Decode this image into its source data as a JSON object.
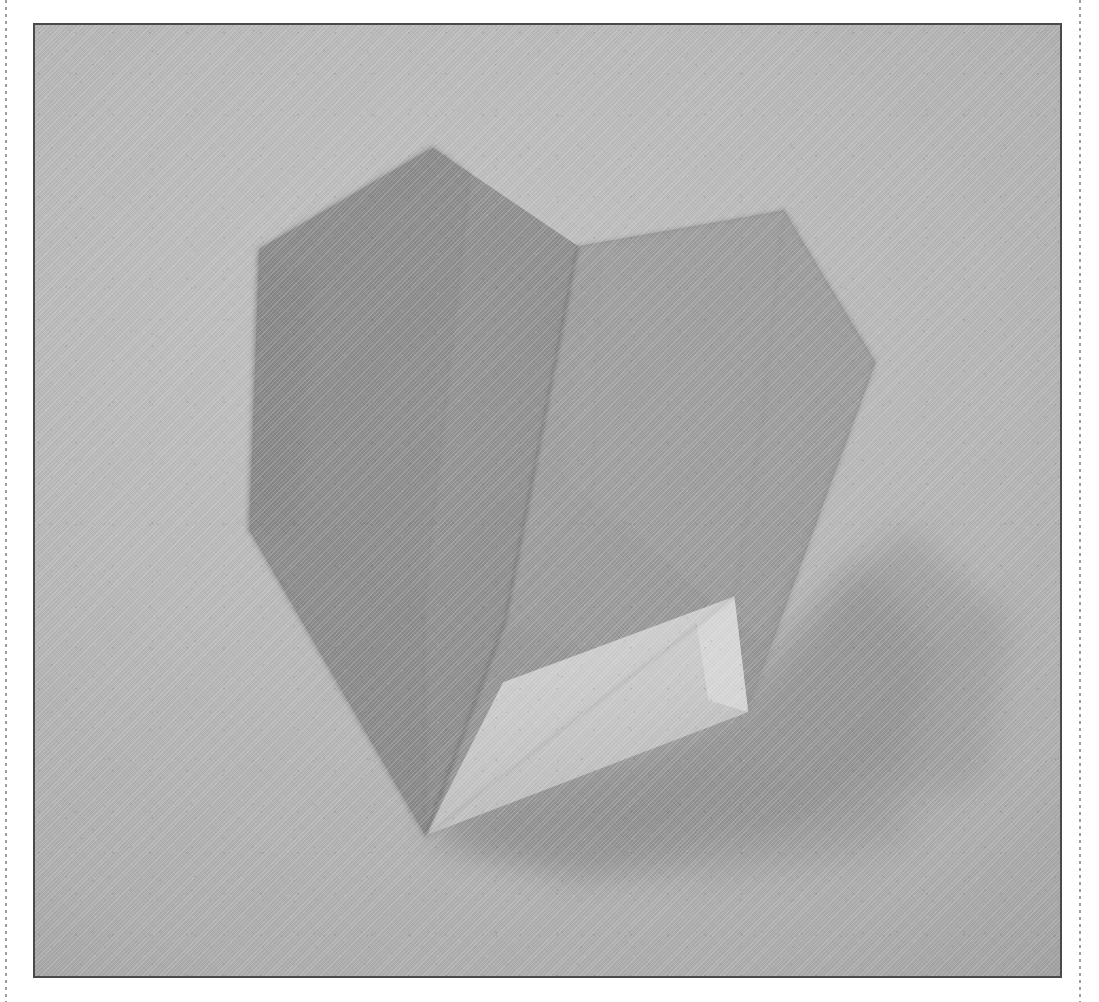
{
  "page": {
    "background_color": "#ffffff",
    "width": 1099,
    "height": 1002,
    "left_rule_name": "perforation-rule-left",
    "right_rule_name": "perforation-rule-right"
  },
  "photo": {
    "caption": "",
    "frame_border_color": "#4a4a4a",
    "backdrop_color": "#b4b4b4",
    "shadow_color": "#9a9a9a",
    "subject": "folded paper origami heart standing upright on a textured grey surface",
    "medium": "halftone print / scanned photograph",
    "frame": {
      "x": 33,
      "y": 23,
      "width": 1029,
      "height": 955
    }
  },
  "palette": {
    "backdrop_light": "#bdbdbd",
    "backdrop_mid": "#b4b4b4",
    "backdrop_dark": "#a4a4a4",
    "left_lobe": "#8d8d8d",
    "left_lobe_dark": "#868686",
    "right_lobe": "#949494",
    "right_lobe_light": "#9b9b9b",
    "front_panel": "#9d9d9d",
    "bright_flap": "#c4c4c4",
    "flap_edge": "#cfcfcf",
    "inner_fold_shade": "#7f7f7f",
    "cast_shadow": "#9a9a9a",
    "cast_shadow_deep": "#8f8f8f",
    "crease_line": "#6f6f6f"
  },
  "origami": {
    "name": "origami-heart",
    "facets": [
      {
        "id": "left-lobe",
        "label": "left lobe upper face",
        "fill": "#8b8b8b",
        "points": "432,146 578,245 505,622 425,837 248,530 258,248"
      },
      {
        "id": "left-lobe-outer-band",
        "label": "left lobe shaded outer band",
        "fill": "#878787",
        "points": "432,146 468,170 420,560 425,837 248,530 258,248"
      },
      {
        "id": "right-lobe",
        "label": "right lobe front face",
        "fill": "#969696",
        "points": "578,245 785,209 877,362 745,710 425,837 505,622"
      },
      {
        "id": "right-lobe-highlight",
        "label": "right lobe highlight wedge",
        "fill": "#9c9c9c",
        "points": "600,250 785,209 877,362 760,640 560,470"
      },
      {
        "id": "bright-flap",
        "label": "bright under flap",
        "fill": "#c6c6c6",
        "points": "735,597 748,712 425,837"
      },
      {
        "id": "flap-edge",
        "label": "flap cut edge highlight",
        "fill": "#d2d2d2",
        "points": "735,597 748,712 700,700 690,620"
      },
      {
        "id": "lower-fold-shade",
        "label": "shaded gusset below centre fold",
        "fill": "#8a8a8a",
        "points": "505,622 735,597 425,837"
      }
    ],
    "creases": [
      {
        "id": "centre-valley",
        "label": "central valley fold",
        "path": "M578,245 L505,622 L425,837",
        "stroke": "#6e6e6e"
      },
      {
        "id": "left-lobe-crease",
        "label": "left lobe ridge crease",
        "path": "M432,146 L468,176 L420,600 L425,837",
        "stroke": "#7b7b7b"
      },
      {
        "id": "right-lobe-crease",
        "label": "right lobe soft crease",
        "path": "M785,209 L760,420 L735,597",
        "stroke": "#8b8b8b"
      },
      {
        "id": "flap-crease",
        "label": "under flap fold edge",
        "path": "M735,597 L425,837",
        "stroke": "#9e9e9e"
      }
    ],
    "shadow": {
      "id": "cast-shadow",
      "label": "cast shadow to the lower right",
      "fill": "#959595",
      "points": "748,712 425,837 560,862 905,770 925,640 860,560"
    }
  }
}
